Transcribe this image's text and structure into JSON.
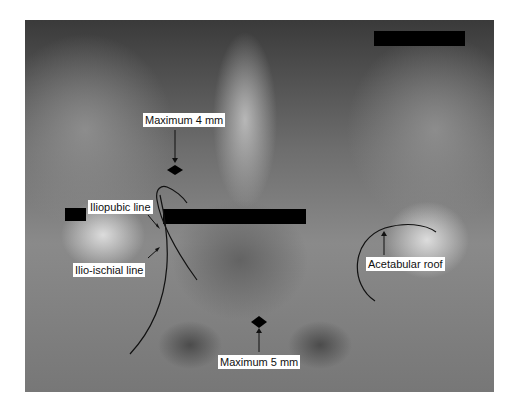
{
  "figure": {
    "labels": {
      "max_top": "Maximum 4 mm",
      "iliopubic": "Iliopubic line",
      "ilioischial": "Ilio-ischial line",
      "acetabular": "Acetabular roof",
      "max_bottom": "Maximum 5 mm"
    },
    "redactions": 3,
    "colors": {
      "annotation": "#111111",
      "label_bg": "#ffffff",
      "redaction": "#000000"
    }
  }
}
